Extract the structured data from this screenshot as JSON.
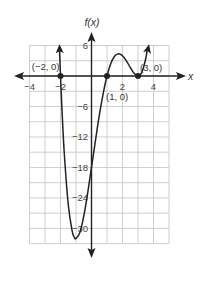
{
  "chart_data": {
    "type": "line",
    "title": "",
    "xlabel": "x",
    "ylabel": "f(x)",
    "xlim": [
      -4,
      5
    ],
    "ylim": [
      -33,
      6
    ],
    "grid": true,
    "grid_step": {
      "x": 1,
      "y": 3
    },
    "x_ticks": [
      {
        "value": -4,
        "label": "−4"
      },
      {
        "value": -2,
        "label": "−2"
      },
      {
        "value": 2,
        "label": "2"
      },
      {
        "value": 4,
        "label": "4"
      }
    ],
    "y_ticks": [
      {
        "value": 6,
        "label": "6"
      },
      {
        "value": -6,
        "label": "−6"
      },
      {
        "value": -12,
        "label": "−12"
      },
      {
        "value": -18,
        "label": "−18"
      },
      {
        "value": -24,
        "label": "−24"
      },
      {
        "value": -30,
        "label": "−30"
      }
    ],
    "series": [
      {
        "name": "f(x)",
        "color": "#222222",
        "arrows": "both-ends",
        "x": [
          -2.07,
          -2.0,
          -1.9,
          -1.75,
          -1.5,
          -1.25,
          -1.1,
          -1.0,
          -0.75,
          -0.5,
          -0.25,
          0,
          0.25,
          0.5,
          0.75,
          1,
          1.25,
          1.5,
          1.75,
          2,
          2.25,
          2.5,
          2.75,
          3,
          3.25,
          3.5,
          3.62
        ],
        "y": [
          5.48,
          0,
          -6.96,
          -15.5,
          -25.3,
          -30.5,
          -31.8,
          -32,
          -30.8,
          -27.6,
          -23.1,
          -18,
          -12.8,
          -7.8,
          -3.5,
          0,
          2.49,
          3.94,
          4.39,
          4,
          2.99,
          1.69,
          0.52,
          0,
          0.74,
          3.44,
          5.66
        ]
      }
    ],
    "annotations": [
      {
        "point": [
          -2,
          0
        ],
        "label": "(−2, 0)"
      },
      {
        "point": [
          1,
          0
        ],
        "label": "(1, 0)"
      },
      {
        "point": [
          3,
          0
        ],
        "label": "(3, 0)"
      }
    ]
  },
  "axes": {
    "x_label": "x",
    "y_label": "f(x)"
  }
}
